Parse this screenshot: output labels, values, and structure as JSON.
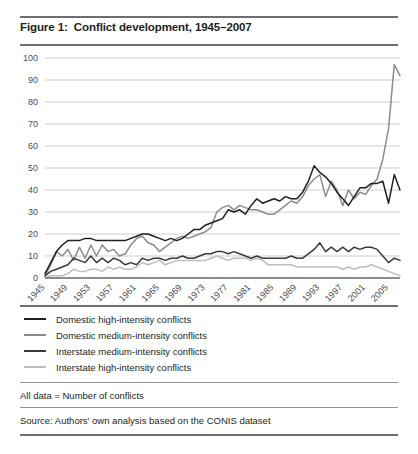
{
  "figure": {
    "title": "Figure 1:  Conflict development, 1945–2007",
    "note": "All data = Number of conflicts",
    "source": "Source: Authors' own analysis based on the CONIS dataset"
  },
  "legend": {
    "items": [
      {
        "label": "Domestic high-intensity conflicts",
        "color": "#231f20"
      },
      {
        "label": "Domestic medium-intensity conflicts",
        "color": "#8a8c8e"
      },
      {
        "label": "Interstate medium-intensity conflicts",
        "color": "#3b3b3d"
      },
      {
        "label": "Interstate high-intensity conflicts",
        "color": "#bcbec0"
      }
    ]
  },
  "chart_data": {
    "type": "line",
    "title": "Conflict development, 1945–2007",
    "xlabel": "",
    "ylabel": "",
    "xlim": [
      1945,
      2007
    ],
    "ylim": [
      0,
      100
    ],
    "ytick_values": [
      0,
      10,
      20,
      30,
      40,
      50,
      60,
      70,
      80,
      90,
      100
    ],
    "xtick_values": [
      1945,
      1949,
      1953,
      1957,
      1961,
      1965,
      1969,
      1973,
      1977,
      1981,
      1985,
      1989,
      1993,
      1997,
      2001,
      2005
    ],
    "grid": "horizontal",
    "legend_position": "below",
    "x": [
      1945,
      1946,
      1947,
      1948,
      1949,
      1950,
      1951,
      1952,
      1953,
      1954,
      1955,
      1956,
      1957,
      1958,
      1959,
      1960,
      1961,
      1962,
      1963,
      1964,
      1965,
      1966,
      1967,
      1968,
      1969,
      1970,
      1971,
      1972,
      1973,
      1974,
      1975,
      1976,
      1977,
      1978,
      1979,
      1980,
      1981,
      1982,
      1983,
      1984,
      1985,
      1986,
      1987,
      1988,
      1989,
      1990,
      1991,
      1992,
      1993,
      1994,
      1995,
      1996,
      1997,
      1998,
      1999,
      2000,
      2001,
      2002,
      2003,
      2004,
      2005,
      2006,
      2007
    ],
    "series": [
      {
        "name": "Domestic high-intensity conflicts",
        "color": "#231f20",
        "values": [
          2,
          7,
          12,
          15,
          17,
          17,
          17,
          18,
          18,
          17,
          17,
          17,
          17,
          17,
          17,
          18,
          19,
          20,
          20,
          19,
          18,
          17,
          18,
          17,
          18,
          20,
          22,
          22,
          24,
          25,
          26,
          27,
          31,
          30,
          31,
          29,
          33,
          36,
          34,
          35,
          36,
          35,
          37,
          36,
          36,
          39,
          44,
          51,
          48,
          46,
          43,
          39,
          36,
          33,
          37,
          41,
          41,
          43,
          43,
          44,
          34,
          47,
          40
        ]
      },
      {
        "name": "Domestic medium-intensity conflicts",
        "color": "#8a8c8e",
        "values": [
          1,
          6,
          12,
          10,
          13,
          8,
          14,
          9,
          15,
          10,
          15,
          12,
          13,
          10,
          11,
          15,
          18,
          19,
          16,
          15,
          12,
          14,
          16,
          18,
          19,
          18,
          19,
          20,
          21,
          23,
          30,
          32,
          33,
          31,
          33,
          32,
          31,
          31,
          30,
          29,
          29,
          31,
          33,
          35,
          34,
          37,
          42,
          45,
          47,
          37,
          44,
          40,
          33,
          40,
          36,
          39,
          38,
          42,
          45,
          54,
          68,
          97,
          92
        ]
      },
      {
        "name": "Interstate medium-intensity conflicts",
        "color": "#3b3b3d",
        "values": [
          1,
          3,
          4,
          5,
          6,
          9,
          8,
          7,
          10,
          7,
          9,
          7,
          9,
          8,
          6,
          7,
          6,
          9,
          8,
          9,
          9,
          8,
          9,
          9,
          10,
          9,
          9,
          10,
          11,
          11,
          12,
          12,
          11,
          12,
          11,
          10,
          9,
          10,
          9,
          9,
          9,
          9,
          9,
          10,
          9,
          9,
          11,
          13,
          16,
          12,
          14,
          12,
          14,
          12,
          14,
          13,
          14,
          14,
          13,
          10,
          7,
          9,
          8
        ]
      },
      {
        "name": "Interstate high-intensity conflicts",
        "color": "#bcbec0",
        "values": [
          0,
          1,
          1,
          1,
          2,
          4,
          3,
          3,
          4,
          4,
          3,
          5,
          4,
          5,
          4,
          4,
          5,
          7,
          6,
          7,
          8,
          6,
          7,
          8,
          8,
          8,
          8,
          8,
          8,
          9,
          10,
          9,
          8,
          9,
          9,
          9,
          8,
          9,
          8,
          6,
          6,
          6,
          6,
          6,
          5,
          5,
          5,
          5,
          5,
          5,
          5,
          5,
          4,
          5,
          4,
          5,
          5,
          6,
          5,
          4,
          3,
          2,
          1
        ]
      }
    ]
  }
}
